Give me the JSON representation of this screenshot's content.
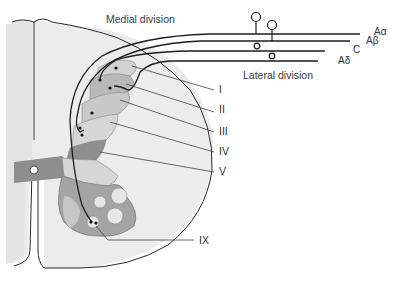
{
  "diagram": {
    "divisions": {
      "medial": "Medial division",
      "lateral": "Lateral division"
    },
    "fibers": [
      {
        "id": "a-alpha",
        "label": "Aα"
      },
      {
        "id": "a-beta",
        "label": "Aβ"
      },
      {
        "id": "c",
        "label": "C"
      },
      {
        "id": "a-delta",
        "label": "Aδ"
      }
    ],
    "laminae": [
      {
        "id": "lamina-1",
        "label": "I"
      },
      {
        "id": "lamina-2",
        "label": "II"
      },
      {
        "id": "lamina-3",
        "label": "III"
      },
      {
        "id": "lamina-4",
        "label": "IV"
      },
      {
        "id": "lamina-5",
        "label": "V"
      },
      {
        "id": "lamina-9",
        "label": "IX"
      }
    ],
    "colors": {
      "white_matter": "#ebebeb",
      "midline_white": "#e2e2e2",
      "gray_light": "#d2d2d2",
      "gray_mid": "#b4b4b4",
      "gray_dark": "#8e8e8e",
      "motor_pools": "#e6e6e6",
      "line": "#2a2a2a"
    }
  }
}
